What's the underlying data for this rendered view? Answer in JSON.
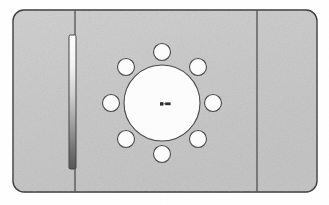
{
  "scene": {
    "title": "Mounting Plate Technical Drawing",
    "view": "front-view",
    "canvas": {
      "width": 329,
      "height": 205
    },
    "background_color": "#ffffff"
  },
  "colors": {
    "plate_fill": "#c9c9c9",
    "plate_fill_light": "#d2d2d2",
    "outline": "#3a3a3a",
    "hole_fill": "#fdfdfd",
    "hole_outline": "#4a4a4a",
    "slot_top": "#ffffff",
    "slot_bottom": "#5a5a5a",
    "slot_outline": "#444444",
    "divider": "#505050",
    "center_mark": "#2a2a2a"
  },
  "plate": {
    "name": "mounting-plate",
    "x": 13,
    "y": 10,
    "width": 304,
    "height": 182,
    "corner_radius": 11,
    "stroke_width": 1.4
  },
  "dividers": [
    {
      "name": "left-divider",
      "label": "left fold line",
      "x": 75,
      "y1": 10,
      "y2": 192
    },
    {
      "name": "right-divider",
      "label": "right fold line",
      "x": 257,
      "y1": 10,
      "y2": 192
    }
  ],
  "slot": {
    "name": "vertical-slot",
    "label": "vertical slot",
    "x": 69,
    "y": 35,
    "width": 7,
    "height": 134,
    "corner_radius": 1.5,
    "gradient": {
      "from": "#ffffff",
      "to": "#585858"
    }
  },
  "center_bore": {
    "name": "center-bore",
    "label": "central bore",
    "cx": 162,
    "cy": 103,
    "r": 38
  },
  "bolt_circle": {
    "name": "bolt-circle",
    "label": "bolt hole pattern",
    "cx": 162,
    "cy": 103,
    "pitch_radius": 51,
    "hole_radius": 8.5,
    "count": 8,
    "start_angle_deg": -90,
    "holes": [
      {
        "name": "bolt-hole-1",
        "angle_deg": -90,
        "cx": 162,
        "cy": 52
      },
      {
        "name": "bolt-hole-2",
        "angle_deg": -45,
        "cx": 198,
        "cy": 67
      },
      {
        "name": "bolt-hole-3",
        "angle_deg": 0,
        "cx": 213,
        "cy": 103
      },
      {
        "name": "bolt-hole-4",
        "angle_deg": 45,
        "cx": 198,
        "cy": 139
      },
      {
        "name": "bolt-hole-5",
        "angle_deg": 90,
        "cx": 162,
        "cy": 154
      },
      {
        "name": "bolt-hole-6",
        "angle_deg": 135,
        "cx": 126,
        "cy": 139
      },
      {
        "name": "bolt-hole-7",
        "angle_deg": 180,
        "cx": 111,
        "cy": 103
      },
      {
        "name": "bolt-hole-8",
        "angle_deg": 225,
        "cx": 126,
        "cy": 67
      }
    ]
  },
  "center_mark": {
    "name": "center-mark",
    "label": "center datum mark",
    "cx": 166,
    "cy": 104,
    "width": 13,
    "height": 4
  }
}
